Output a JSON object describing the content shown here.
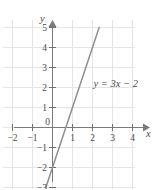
{
  "chart_data": {
    "type": "line",
    "title": "",
    "subtitle": "",
    "xlabel": "x",
    "ylabel": "y",
    "xlim": [
      -2.6,
      4.4
    ],
    "ylim": [
      -3.6,
      5.5
    ],
    "grid": true,
    "grid_step": 1,
    "legend": "none",
    "annotations": [
      {
        "text": "y = 3x − 2",
        "x": 2.05,
        "y": 2.2
      }
    ],
    "x_ticks": [
      -2,
      -1,
      1,
      2,
      3,
      4
    ],
    "x_tick_labels": [
      "−2",
      "−1",
      "1",
      "2",
      "3",
      "4"
    ],
    "y_ticks": [
      5,
      4,
      3,
      2,
      1,
      -1,
      -2,
      -3
    ],
    "y_tick_labels": [
      "5",
      "4",
      "3",
      "2",
      "1",
      "−1",
      "−2",
      "−3"
    ],
    "origin_label": "0",
    "series": [
      {
        "name": "y = 3x − 2",
        "equation": "y = 3x - 2",
        "slope": 3,
        "intercept": -2,
        "x": [
          -0.333,
          2.333
        ],
        "values": [
          -3,
          5
        ],
        "points": [
          {
            "x": 0,
            "y": -2
          },
          {
            "x": 0.667,
            "y": 0
          },
          {
            "x": 1,
            "y": 1
          },
          {
            "x": 2,
            "y": 4
          }
        ]
      }
    ],
    "colors": {
      "grid": "#e4e4e4",
      "axis": "#7b7b7b",
      "line": "#8f8f8f",
      "text": "#4a4a4a",
      "background": "#ffffff"
    }
  }
}
